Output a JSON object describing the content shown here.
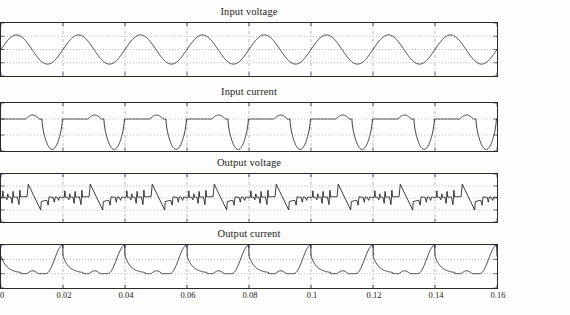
{
  "figure": {
    "background": "#fdfdfb",
    "line_color": "#1a1a1a",
    "grid_color": "#7d7d7d",
    "axis_color": "#2b2b2b"
  },
  "chart_data": [
    {
      "type": "line",
      "title": "Input voltage",
      "xlabel": "",
      "ylabel": "",
      "xlim": [
        0,
        0.16
      ],
      "ylim": [
        -400,
        400
      ],
      "xticks": [
        0,
        0.02,
        0.04,
        0.06,
        0.08,
        0.1,
        0.12,
        0.14,
        0.16
      ],
      "xticklabels": [
        "",
        "",
        "",
        "",
        "",
        "",
        "",
        "",
        ""
      ],
      "yticks": [
        -400,
        -200,
        0,
        200,
        400
      ],
      "yticklabels": [
        "-400",
        "-200",
        "0",
        "200",
        "400"
      ],
      "grid": true,
      "legend": "none",
      "description": "Sinusoidal mains voltage, amplitude about 220 V, frequency 50 Hz (period 0.02 s), eight cycles shown",
      "series": [
        {
          "name": "input voltage",
          "waveform": "sine",
          "amplitude": 220,
          "period": 0.02,
          "phase": 0,
          "offset": 0
        }
      ]
    },
    {
      "type": "line",
      "title": "Input current",
      "xlabel": "",
      "ylabel": "",
      "xlim": [
        0,
        0.16
      ],
      "ylim": [
        -40,
        20
      ],
      "xticks": [
        0,
        0.02,
        0.04,
        0.06,
        0.08,
        0.1,
        0.12,
        0.14,
        0.16
      ],
      "xticklabels": [
        "",
        "",
        "",
        "",
        "",
        "",
        "",
        "",
        ""
      ],
      "yticks": [
        -40,
        -20,
        0,
        20
      ],
      "yticklabels": [
        "-40",
        "-20",
        "0",
        "20"
      ],
      "grid": true,
      "legend": "none",
      "description": "Discontinuous rectifier input current: near zero baseline with small positive humps around +5 A and deep negative conduction pulses reaching about -38 A once per 0.02 s period",
      "series": [
        {
          "name": "input current",
          "positive_hump_peak": 5,
          "negative_pulse_peak": -38,
          "period": 0.02,
          "baseline": 0
        }
      ]
    },
    {
      "type": "line",
      "title": "Output voltage",
      "xlabel": "",
      "ylabel": "",
      "xlim": [
        0,
        0.16
      ],
      "ylim": [
        -400,
        400
      ],
      "xticks": [
        0,
        0.02,
        0.04,
        0.06,
        0.08,
        0.1,
        0.12,
        0.14,
        0.16
      ],
      "xticklabels": [
        "",
        "",
        "",
        "",
        "",
        "",
        "",
        "",
        ""
      ],
      "yticks": [
        -400,
        -200,
        0,
        200,
        400
      ],
      "yticklabels": [
        "-400",
        "-200",
        "0",
        "200",
        "400"
      ],
      "grid": true,
      "legend": "none",
      "description": "Chopped converter output voltage: switching notches near zero, ramps rising to about +230 V then falling steeply to about -200 V, repeating every 0.02 s",
      "series": [
        {
          "name": "output voltage",
          "max_peak": 230,
          "min_peak": -200,
          "period": 0.02,
          "baseline": 0
        }
      ]
    },
    {
      "type": "line",
      "title": "Output current",
      "xlabel": "",
      "ylabel": "",
      "xlim": [
        0,
        0.16
      ],
      "ylim": [
        -20,
        40
      ],
      "xticks": [
        0,
        0.02,
        0.04,
        0.06,
        0.08,
        0.1,
        0.12,
        0.14,
        0.16
      ],
      "xticklabels": [
        "0",
        "0.02",
        "0.04",
        "0.06",
        "0.08",
        "0.1",
        "0.12",
        "0.14",
        "0.16"
      ],
      "yticks": [
        -20,
        0,
        20,
        40
      ],
      "yticklabels": [
        "-20",
        "0",
        "20",
        "40"
      ],
      "grid": true,
      "legend": "none",
      "description": "Pulsed load current: main pulses peaking near 40 A at each 0.02 s interval with a decaying tail and small secondary bumps about 4 A between pulses",
      "series": [
        {
          "name": "output current",
          "peak": 40,
          "secondary_bump": 4,
          "period": 0.02,
          "baseline": 0
        }
      ]
    }
  ]
}
